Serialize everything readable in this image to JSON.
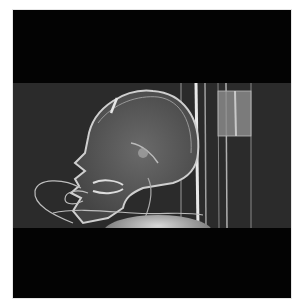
{
  "image": {
    "description": "Lateral skull scout radiograph (CT topogram) of a patient's head in profile facing left, with tubing near the mouth, vertical support rods on the right, and black padding bands above and below",
    "colors": {
      "background": "#ffffff",
      "padding": "#030303",
      "radiograph_bg": "#2b2b2b",
      "bone": "#c8c8c8"
    }
  }
}
